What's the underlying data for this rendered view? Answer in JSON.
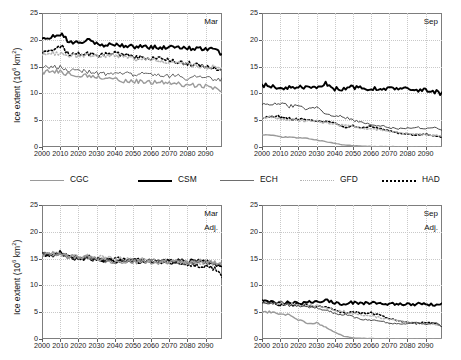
{
  "figure": {
    "ylabel_main": "Ice extent (10",
    "ylabel_sup": "6",
    "ylabel_tail": " km",
    "ylabel_sup2": "2",
    "ylabel_close": ")",
    "ylabel_full": "Ice extent (10^6 km^2)"
  },
  "axes": {
    "yticks": [
      "0",
      "5",
      "10",
      "15",
      "20",
      "25"
    ],
    "ytick_values": [
      0,
      5,
      10,
      15,
      20,
      25
    ],
    "ylim": [
      0,
      25
    ],
    "xticks": [
      "2000",
      "2010",
      "2020",
      "2030",
      "2040",
      "2050",
      "2060",
      "2070",
      "2080",
      "2090"
    ],
    "xtick_values": [
      2000,
      2010,
      2020,
      2030,
      2040,
      2050,
      2060,
      2070,
      2080,
      2090
    ],
    "xlim": [
      2000,
      2099
    ],
    "grid": true
  },
  "legend": {
    "position": "center-between-rows",
    "items": [
      {
        "label": "CGC",
        "style": "solid",
        "color": "#9a9a9a",
        "width": 1.6
      },
      {
        "label": "CSM",
        "style": "solid",
        "color": "#000000",
        "width": 2.6
      },
      {
        "label": "ECH",
        "style": "solid",
        "color": "#6e6e6e",
        "width": 0.9
      },
      {
        "label": "GFD",
        "style": "dotted",
        "color": "#b4b4b4",
        "width": 1.6
      },
      {
        "label": "HAD",
        "style": "dotted",
        "color": "#000000",
        "width": 2.2
      }
    ]
  },
  "panels": [
    {
      "id": "mar",
      "tag": [
        "Mar"
      ],
      "position": "top-left"
    },
    {
      "id": "sep",
      "tag": [
        "Sep"
      ],
      "position": "top-right"
    },
    {
      "id": "mar_adj",
      "tag": [
        "Mar",
        "Adj."
      ],
      "position": "bottom-left"
    },
    {
      "id": "sep_adj",
      "tag": [
        "Sep",
        "Adj."
      ],
      "position": "bottom-right"
    }
  ],
  "chart_data": [
    {
      "type": "line",
      "panel": "mar",
      "title": "Mar",
      "xlabel": "",
      "ylabel": "Ice extent (10^6 km^2)",
      "xlim": [
        2000,
        2099
      ],
      "ylim": [
        0,
        25
      ],
      "x": [
        2000,
        2005,
        2010,
        2015,
        2020,
        2025,
        2030,
        2035,
        2040,
        2045,
        2050,
        2055,
        2060,
        2065,
        2070,
        2075,
        2080,
        2085,
        2090,
        2095,
        2099
      ],
      "series": [
        {
          "name": "CSM",
          "color": "#000000",
          "style": "solid",
          "width": 1.9,
          "values": [
            20.3,
            20.4,
            21.2,
            19.6,
            19.4,
            19.9,
            19.2,
            19.0,
            19.1,
            18.9,
            18.8,
            18.7,
            18.7,
            18.6,
            18.5,
            18.5,
            18.4,
            18.5,
            18.4,
            18.0,
            17.4
          ]
        },
        {
          "name": "HAD",
          "color": "#000000",
          "style": "dotted",
          "width": 1.6,
          "values": [
            17.4,
            17.7,
            18.9,
            17.4,
            17.3,
            17.4,
            17.0,
            17.2,
            17.4,
            17.2,
            16.9,
            16.7,
            16.5,
            16.4,
            16.2,
            15.8,
            15.6,
            15.4,
            15.1,
            14.8,
            14.5
          ]
        },
        {
          "name": "GFD",
          "color": "#b4b4b4",
          "style": "dotted",
          "width": 1.5,
          "values": [
            17.2,
            17.4,
            17.6,
            17.1,
            17.0,
            17.1,
            16.9,
            16.9,
            17.0,
            16.8,
            16.6,
            16.4,
            16.3,
            16.1,
            15.9,
            15.6,
            15.4,
            15.2,
            15.0,
            14.9,
            14.7
          ]
        },
        {
          "name": "ECH",
          "color": "#4a4a4a",
          "style": "solid",
          "width": 0.85,
          "values": [
            15.0,
            14.9,
            14.9,
            14.3,
            14.2,
            14.1,
            13.9,
            13.7,
            13.6,
            13.7,
            13.5,
            13.6,
            13.5,
            13.4,
            13.3,
            13.2,
            12.8,
            13.1,
            13.0,
            12.7,
            12.6
          ]
        },
        {
          "name": "CGC",
          "color": "#9a9a9a",
          "style": "solid",
          "width": 1.4,
          "values": [
            13.9,
            14.1,
            14.0,
            13.6,
            13.4,
            13.3,
            13.0,
            12.8,
            12.5,
            12.4,
            12.3,
            12.2,
            12.1,
            12.0,
            11.9,
            11.7,
            11.3,
            11.6,
            11.4,
            11.0,
            10.5
          ]
        }
      ]
    },
    {
      "type": "line",
      "panel": "sep",
      "title": "Sep",
      "xlabel": "",
      "ylabel": "Ice extent (10^6 km^2)",
      "xlim": [
        2000,
        2099
      ],
      "ylim": [
        0,
        25
      ],
      "x": [
        2000,
        2005,
        2010,
        2015,
        2020,
        2025,
        2030,
        2035,
        2040,
        2045,
        2050,
        2055,
        2060,
        2065,
        2070,
        2075,
        2080,
        2085,
        2090,
        2095,
        2099
      ],
      "series": [
        {
          "name": "CSM",
          "color": "#000000",
          "style": "solid",
          "width": 1.9,
          "values": [
            11.6,
            11.4,
            10.6,
            11.1,
            11.0,
            11.3,
            11.2,
            11.9,
            10.9,
            10.9,
            11.1,
            10.9,
            11.0,
            10.9,
            10.8,
            10.7,
            10.8,
            10.6,
            10.6,
            10.4,
            9.9
          ]
        },
        {
          "name": "ECH",
          "color": "#2a2a2a",
          "style": "solid",
          "width": 0.85,
          "values": [
            8.2,
            7.7,
            8.3,
            7.6,
            7.6,
            7.1,
            7.3,
            6.4,
            5.8,
            5.6,
            5.0,
            4.5,
            4.2,
            4.0,
            3.6,
            3.4,
            3.5,
            3.7,
            3.4,
            3.8,
            3.0
          ]
        },
        {
          "name": "HAD",
          "color": "#000000",
          "style": "dotted",
          "width": 1.6,
          "values": [
            5.6,
            5.8,
            5.6,
            5.3,
            5.2,
            5.1,
            5.0,
            4.7,
            4.4,
            3.6,
            3.9,
            3.6,
            3.8,
            3.4,
            3.0,
            2.6,
            2.4,
            2.2,
            2.4,
            2.1,
            1.8
          ]
        },
        {
          "name": "GFD",
          "color": "#b4b4b4",
          "style": "dotted",
          "width": 1.5,
          "values": [
            5.4,
            5.5,
            5.3,
            5.1,
            5.0,
            4.9,
            4.8,
            4.5,
            4.3,
            4.0,
            3.8,
            3.5,
            3.4,
            3.2,
            2.9,
            2.7,
            2.5,
            2.4,
            2.3,
            2.2,
            2.0
          ]
        },
        {
          "name": "CGC",
          "color": "#9a9a9a",
          "style": "solid",
          "width": 1.4,
          "values": [
            2.3,
            2.2,
            1.9,
            1.8,
            1.7,
            1.6,
            1.3,
            1.0,
            0.7,
            0.4,
            0.25,
            0.15,
            0.1,
            0.08,
            0.06,
            0.05,
            0.04,
            0.04,
            0.03,
            0.03,
            0.02
          ]
        }
      ]
    },
    {
      "type": "line",
      "panel": "mar_adj",
      "title": "Mar Adj.",
      "xlabel": "",
      "ylabel": "Ice extent (10^6 km^2)",
      "xlim": [
        2000,
        2099
      ],
      "ylim": [
        0,
        25
      ],
      "x": [
        2000,
        2005,
        2010,
        2015,
        2020,
        2025,
        2030,
        2035,
        2040,
        2045,
        2050,
        2055,
        2060,
        2065,
        2070,
        2075,
        2080,
        2085,
        2090,
        2095,
        2099
      ],
      "series": [
        {
          "name": "CSM",
          "color": "#000000",
          "style": "solid",
          "width": 1.9,
          "values": [
            15.8,
            15.7,
            16.0,
            15.2,
            15.1,
            15.2,
            14.9,
            14.5,
            14.5,
            14.6,
            14.5,
            14.6,
            14.4,
            14.4,
            14.4,
            14.5,
            14.4,
            14.5,
            14.4,
            14.1,
            13.5
          ]
        },
        {
          "name": "HAD",
          "color": "#000000",
          "style": "dotted",
          "width": 1.5,
          "values": [
            15.6,
            15.8,
            16.3,
            15.3,
            15.2,
            15.3,
            14.9,
            15.0,
            15.1,
            14.9,
            14.7,
            14.6,
            14.4,
            14.4,
            14.3,
            14.1,
            14.0,
            13.8,
            13.6,
            13.1,
            11.9
          ]
        },
        {
          "name": "GFD",
          "color": "#b4b4b4",
          "style": "dotted",
          "width": 1.4,
          "values": [
            15.7,
            15.8,
            15.9,
            15.4,
            15.3,
            15.4,
            15.2,
            15.2,
            15.2,
            15.0,
            14.9,
            14.8,
            14.7,
            14.6,
            14.5,
            14.4,
            14.3,
            14.2,
            14.1,
            14.0,
            13.8
          ]
        },
        {
          "name": "ECH",
          "color": "#4a4a4a",
          "style": "solid",
          "width": 0.85,
          "values": [
            15.9,
            15.8,
            15.9,
            15.2,
            15.1,
            15.1,
            14.8,
            14.6,
            14.5,
            14.7,
            14.5,
            14.7,
            14.6,
            14.5,
            14.4,
            14.4,
            14.0,
            14.4,
            14.3,
            14.0,
            13.9
          ]
        },
        {
          "name": "CGC",
          "color": "#9a9a9a",
          "style": "solid",
          "width": 1.4,
          "values": [
            15.7,
            16.0,
            15.9,
            15.4,
            15.2,
            15.2,
            14.9,
            14.7,
            14.5,
            14.4,
            14.4,
            14.4,
            14.3,
            14.3,
            14.4,
            14.4,
            14.1,
            14.6,
            14.5,
            14.2,
            13.7
          ]
        }
      ]
    },
    {
      "type": "line",
      "panel": "sep_adj",
      "title": "Sep Adj.",
      "xlabel": "",
      "ylabel": "Ice extent (10^6 km^2)",
      "xlim": [
        2000,
        2099
      ],
      "ylim": [
        0,
        25
      ],
      "x": [
        2000,
        2005,
        2010,
        2015,
        2020,
        2025,
        2030,
        2035,
        2040,
        2045,
        2050,
        2055,
        2060,
        2065,
        2070,
        2075,
        2080,
        2085,
        2090,
        2095,
        2099
      ],
      "series": [
        {
          "name": "CSM",
          "color": "#000000",
          "style": "solid",
          "width": 1.9,
          "values": [
            7.0,
            6.9,
            6.5,
            6.8,
            6.7,
            7.0,
            6.9,
            7.3,
            6.7,
            6.6,
            6.8,
            6.6,
            6.7,
            6.6,
            6.6,
            6.5,
            6.6,
            6.5,
            6.5,
            6.4,
            6.4
          ]
        },
        {
          "name": "HAD",
          "color": "#000000",
          "style": "dotted",
          "width": 1.5,
          "values": [
            7.1,
            6.9,
            6.6,
            6.5,
            6.4,
            6.3,
            6.2,
            5.9,
            5.6,
            4.8,
            5.1,
            4.7,
            4.9,
            4.4,
            3.9,
            3.4,
            3.2,
            2.9,
            3.1,
            2.8,
            2.4
          ]
        },
        {
          "name": "GFD",
          "color": "#b4b4b4",
          "style": "dotted",
          "width": 1.4,
          "values": [
            6.8,
            6.7,
            6.6,
            6.4,
            6.3,
            6.2,
            6.1,
            5.8,
            5.5,
            5.1,
            4.8,
            4.5,
            4.3,
            4.0,
            3.7,
            3.4,
            3.2,
            3.0,
            2.9,
            2.7,
            2.5
          ]
        },
        {
          "name": "ECH",
          "color": "#2a2a2a",
          "style": "solid",
          "width": 0.85,
          "values": [
            6.9,
            6.6,
            6.9,
            6.3,
            6.3,
            5.9,
            6.0,
            5.3,
            4.8,
            4.6,
            4.1,
            3.7,
            3.5,
            3.3,
            3.0,
            2.8,
            2.9,
            3.0,
            2.8,
            3.1,
            2.3
          ]
        },
        {
          "name": "CGC",
          "color": "#9a9a9a",
          "style": "solid",
          "width": 1.4,
          "values": [
            5.1,
            5.0,
            4.7,
            4.5,
            3.6,
            2.9,
            3.0,
            2.2,
            1.3,
            0.5,
            0.2,
            0.12,
            0.08,
            0.06,
            0.05,
            0.04,
            0.03,
            0.03,
            0.02,
            0.02,
            0.02
          ]
        }
      ]
    }
  ]
}
